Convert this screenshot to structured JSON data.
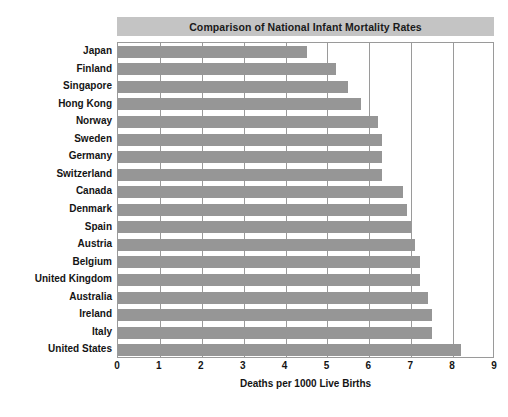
{
  "chart_data": {
    "type": "bar",
    "orientation": "horizontal",
    "title": "Comparison of National Infant Mortality Rates",
    "xlabel": "Deaths per 1000 Live Births",
    "ylabel": "",
    "xlim": [
      0,
      9
    ],
    "xticks": [
      0,
      1,
      2,
      3,
      4,
      5,
      6,
      7,
      8,
      9
    ],
    "xtick_labels": [
      "0",
      "1",
      "2",
      "3",
      "4",
      "5",
      "6",
      "7",
      "8",
      "9"
    ],
    "grid": "vertical",
    "legend": "none",
    "categories": [
      "Japan",
      "Finland",
      "Singapore",
      "Hong Kong",
      "Norway",
      "Sweden",
      "Germany",
      "Switzerland",
      "Canada",
      "Denmark",
      "Spain",
      "Austria",
      "Belgium",
      "United Kingdom",
      "Australia",
      "Ireland",
      "Italy",
      "United States"
    ],
    "values": [
      4.5,
      5.2,
      5.5,
      5.8,
      6.2,
      6.3,
      6.3,
      6.3,
      6.8,
      6.9,
      7.0,
      7.1,
      7.2,
      7.2,
      7.4,
      7.5,
      7.5,
      8.2
    ],
    "colors": {
      "bar": "#969696",
      "title_banner": "#c4c4c4",
      "gridline": "#9a9a9a",
      "plot_border": "#9a9a9a",
      "text": "#141414",
      "background": "#ffffff"
    }
  }
}
